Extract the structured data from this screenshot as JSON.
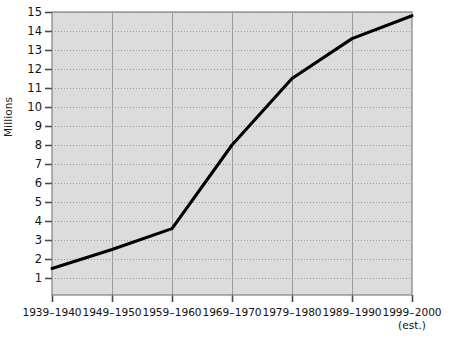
{
  "chart_data": {
    "type": "line",
    "title": "",
    "xlabel": "",
    "ylabel": "Millions",
    "categories": [
      "1939–1940",
      "1949–1950",
      "1959–1960",
      "1969–1970",
      "1979–1980",
      "1989–1990",
      "1999–2000"
    ],
    "x_tick_sublabels": [
      "",
      "",
      "",
      "",
      "",
      "",
      "(est.)"
    ],
    "values": [
      1.5,
      2.5,
      3.6,
      8.0,
      11.5,
      13.6,
      14.8
    ],
    "ylim": [
      0,
      15
    ],
    "y_ticks": [
      1,
      2,
      3,
      4,
      5,
      6,
      7,
      8,
      9,
      10,
      11,
      12,
      13,
      14,
      15
    ],
    "y_tick_labels": [
      "1",
      "2",
      "3",
      "4",
      "5",
      "6",
      "7",
      "8",
      "9",
      "10",
      "11",
      "12",
      "13",
      "14",
      "15"
    ],
    "grid": true,
    "grid_style": "dotted",
    "legend": "none",
    "plot_background": "#dcdcdc",
    "line_color": "#000000",
    "grid_color": "#9a9a9a",
    "axis_color": "#808080",
    "text_color": "#111111"
  }
}
